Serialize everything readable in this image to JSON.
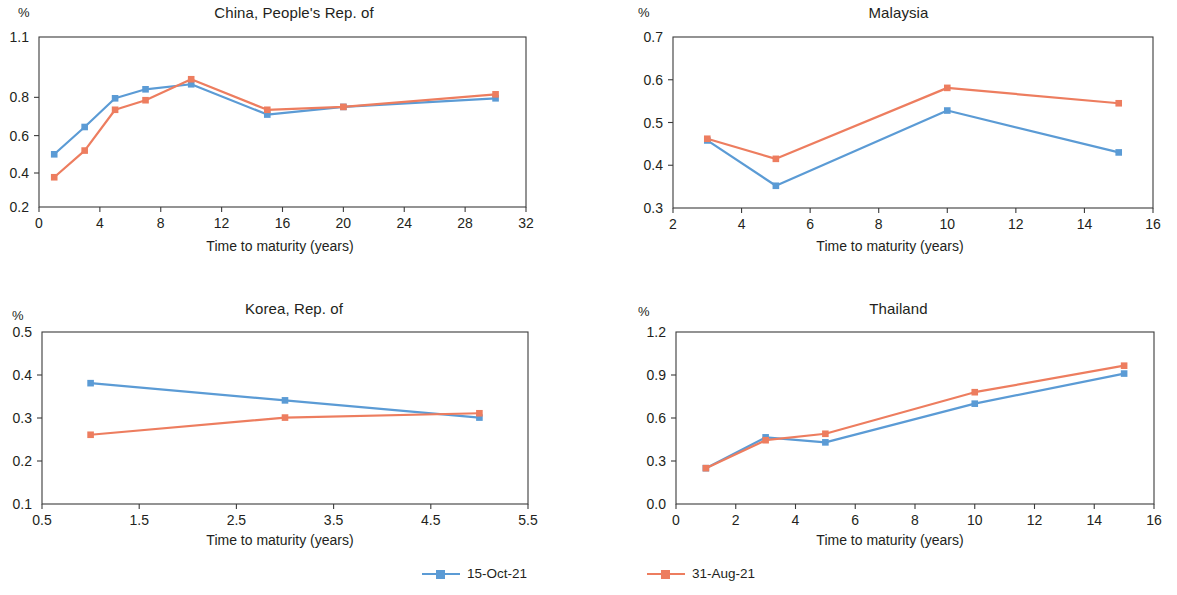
{
  "axis_title": "Time to maturity (years)",
  "unit_label": "%",
  "colors": {
    "series1": "#5B9BD5",
    "series2": "#ED7D5F",
    "axis": "#3b3b3b",
    "text": "#231f20"
  },
  "legend": {
    "items": [
      {
        "label": "15-Oct-21",
        "color": "#5B9BD5"
      },
      {
        "label": "31-Aug-21",
        "color": "#ED7D5F"
      }
    ]
  },
  "chart_data": [
    {
      "type": "line",
      "title": "China, People's Rep. of",
      "xlabel": "Time to maturity (years)",
      "ylabel": "%",
      "xlim": [
        0,
        32
      ],
      "ylim": [
        0.2,
        1.1
      ],
      "xticks": [
        0,
        4,
        8,
        12,
        16,
        20,
        24,
        28,
        32
      ],
      "xticklabels": [
        "0",
        "4",
        "8",
        "12",
        "16",
        "20",
        "24",
        "28",
        "32"
      ],
      "yticks": [
        0.2,
        0.4,
        0.6,
        0.8,
        1.1
      ],
      "yticklabels": [
        "0.2",
        "0.4",
        "0.6",
        "0.8",
        "1.1"
      ],
      "grid": false,
      "series": [
        {
          "name": "15-Oct-21",
          "color": "#5B9BD5",
          "x": [
            1,
            3,
            5,
            7,
            10,
            15,
            20,
            30
          ],
          "values": [
            0.5,
            0.645,
            0.795,
            0.84,
            0.865,
            0.71,
            0.75,
            0.795
          ]
        },
        {
          "name": "31-Aug-21",
          "color": "#ED7D5F",
          "x": [
            1,
            3,
            5,
            7,
            10,
            15,
            20,
            30
          ],
          "values": [
            0.375,
            0.52,
            0.735,
            0.785,
            0.89,
            0.735,
            0.75,
            0.815
          ]
        }
      ]
    },
    {
      "type": "line",
      "title": "Malaysia",
      "xlabel": "Time to maturity (years)",
      "ylabel": "%",
      "xlim": [
        2,
        16
      ],
      "ylim": [
        0.3,
        0.7
      ],
      "xticks": [
        2,
        4,
        6,
        8,
        10,
        12,
        14,
        16
      ],
      "xticklabels": [
        "2",
        "4",
        "6",
        "8",
        "10",
        "12",
        "14",
        "16"
      ],
      "yticks": [
        0.3,
        0.4,
        0.5,
        0.6,
        0.7
      ],
      "yticklabels": [
        "0.3",
        "0.4",
        "0.5",
        "0.6",
        "0.7"
      ],
      "grid": false,
      "series": [
        {
          "name": "15-Oct-21",
          "color": "#5B9BD5",
          "x": [
            3,
            5,
            10,
            15
          ],
          "values": [
            0.458,
            0.352,
            0.528,
            0.43
          ]
        },
        {
          "name": "31-Aug-21",
          "color": "#ED7D5F",
          "x": [
            3,
            5,
            10,
            15
          ],
          "values": [
            0.462,
            0.415,
            0.581,
            0.545
          ]
        }
      ]
    },
    {
      "type": "line",
      "title": "Korea, Rep. of",
      "xlabel": "Time to maturity (years)",
      "ylabel": "%",
      "xlim": [
        0.5,
        5.5
      ],
      "ylim": [
        0.1,
        0.5
      ],
      "xticks": [
        0.5,
        1.5,
        2.5,
        3.5,
        4.5,
        5.5
      ],
      "xticklabels": [
        "0.5",
        "1.5",
        "2.5",
        "3.5",
        "4.5",
        "5.5"
      ],
      "yticks": [
        0.1,
        0.2,
        0.3,
        0.4,
        0.5
      ],
      "yticklabels": [
        "0.1",
        "0.2",
        "0.3",
        "0.4",
        "0.5"
      ],
      "grid": false,
      "series": [
        {
          "name": "15-Oct-21",
          "color": "#5B9BD5",
          "x": [
            1,
            3,
            5
          ],
          "values": [
            0.381,
            0.341,
            0.301
          ]
        },
        {
          "name": "31-Aug-21",
          "color": "#ED7D5F",
          "x": [
            1,
            3,
            5
          ],
          "values": [
            0.261,
            0.301,
            0.311
          ]
        }
      ]
    },
    {
      "type": "line",
      "title": "Thailand",
      "xlabel": "Time to maturity (years)",
      "ylabel": "%",
      "xlim": [
        0,
        16
      ],
      "ylim": [
        0.0,
        1.2
      ],
      "xticks": [
        0,
        2,
        4,
        6,
        8,
        10,
        12,
        14,
        16
      ],
      "xticklabels": [
        "0",
        "2",
        "4",
        "6",
        "8",
        "10",
        "12",
        "14",
        "16"
      ],
      "yticks": [
        0.0,
        0.3,
        0.6,
        0.9,
        1.2
      ],
      "yticklabels": [
        "0.0",
        "0.3",
        "0.6",
        "0.9",
        "1.2"
      ],
      "grid": false,
      "series": [
        {
          "name": "15-Oct-21",
          "color": "#5B9BD5",
          "x": [
            1,
            3,
            5,
            10,
            15
          ],
          "values": [
            0.25,
            0.465,
            0.43,
            0.7,
            0.91
          ]
        },
        {
          "name": "31-Aug-21",
          "color": "#ED7D5F",
          "x": [
            1,
            3,
            5,
            10,
            15
          ],
          "values": [
            0.25,
            0.445,
            0.49,
            0.78,
            0.965
          ]
        }
      ]
    }
  ]
}
